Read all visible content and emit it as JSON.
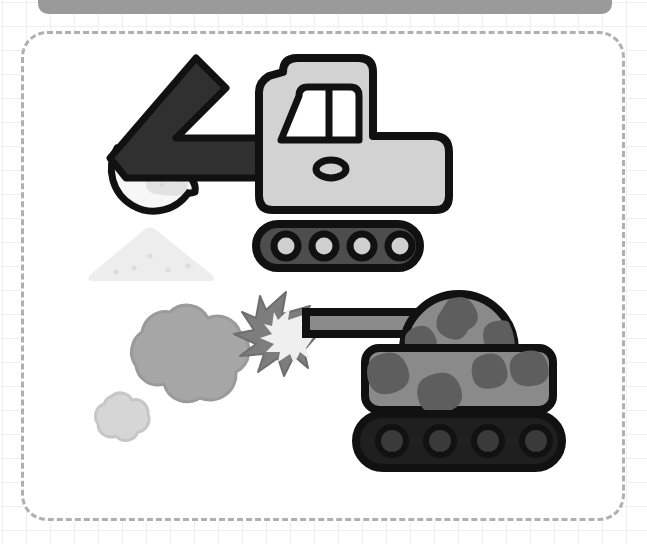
{
  "canvas": {
    "width": 647,
    "height": 544,
    "background": "#ffffff"
  },
  "decor": {
    "top_bar": {
      "name": "top-handle-bar",
      "color": "#9a9a9a"
    },
    "grid": {
      "name": "background-grid",
      "color": "#efefef",
      "cell": 24
    },
    "frame": {
      "name": "dashed-content-frame",
      "color": "#b0b0b0",
      "style": "dashed",
      "radius": 26
    }
  },
  "palette": {
    "outline": "#111111",
    "excavator_body": "#d2d2d2",
    "excavator_arm": "#303030",
    "window_fill": "#ffffff",
    "track_body": "#4d4d4d",
    "track_wheel": "#cfcfcf",
    "dirt_pile": "#ededed",
    "dirt_chunk": "#e2e2e2",
    "smoke_large": "#a6a6a6",
    "smoke_small": "#d6d6d6",
    "tank_base": "#8a8a8a",
    "tank_camo": "#5e5e5e",
    "tank_track": "#1f1f1f",
    "tank_wheel": "#3a3a3a",
    "muzzle_outer": "#7d7d7d",
    "muzzle_inner": "#efefef"
  },
  "objects": [
    {
      "name": "excavator",
      "label": "Excavator",
      "parts": [
        "arm",
        "bucket",
        "cab",
        "window",
        "body",
        "track"
      ]
    },
    {
      "name": "dirt-pile",
      "label": "Dirt pile"
    },
    {
      "name": "smoke-cloud-large",
      "label": "Large smoke cloud"
    },
    {
      "name": "smoke-cloud-small",
      "label": "Small smoke cloud"
    },
    {
      "name": "muzzle-flash",
      "label": "Muzzle flash"
    },
    {
      "name": "tank",
      "label": "Camouflage tank",
      "parts": [
        "barrel",
        "turret",
        "hull",
        "track"
      ]
    }
  ]
}
